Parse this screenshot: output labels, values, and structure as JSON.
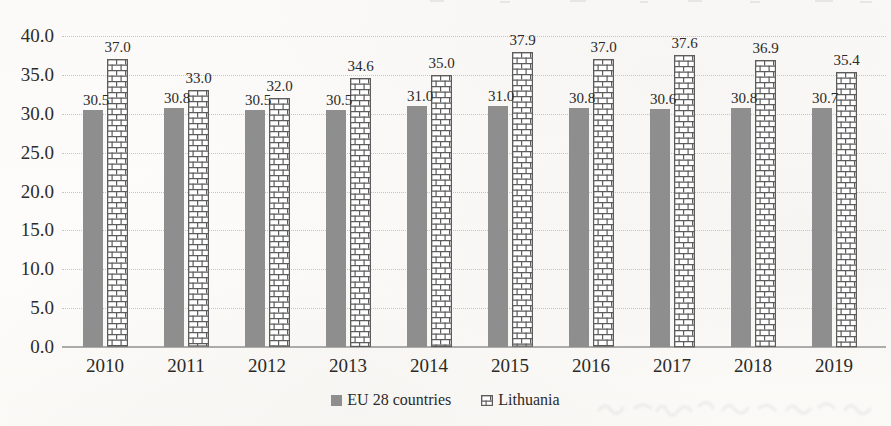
{
  "chart_data": {
    "type": "bar",
    "title": "",
    "xlabel": "",
    "ylabel": "",
    "categories": [
      "2010",
      "2011",
      "2012",
      "2013",
      "2014",
      "2015",
      "2016",
      "2017",
      "2018",
      "2019"
    ],
    "series": [
      {
        "name": "EU 28 countries",
        "pattern": "solid",
        "color": "#8e8e8e",
        "values": [
          30.5,
          30.8,
          30.5,
          30.5,
          31.0,
          31.0,
          30.8,
          30.6,
          30.8,
          30.7
        ],
        "labels": [
          "30.5",
          "30.8",
          "30.5",
          "30.5",
          "31.0",
          "31.0",
          "30.8",
          "30.6",
          "30.8",
          "30.7"
        ]
      },
      {
        "name": "Lithuania",
        "pattern": "brick",
        "color": "#ffffff",
        "outline": "#5c5c5c",
        "values": [
          37.0,
          33.0,
          32.0,
          34.6,
          35.0,
          37.9,
          37.0,
          37.6,
          36.9,
          35.4
        ],
        "labels": [
          "37.0",
          "33.0",
          "32.0",
          "34.6",
          "35.0",
          "37.9",
          "37.0",
          "37.6",
          "36.9",
          "35.4"
        ]
      }
    ],
    "ylim": [
      0,
      40
    ],
    "ytick_step": 5,
    "ytick_labels": [
      "0.0",
      "5.0",
      "10.0",
      "15.0",
      "20.0",
      "25.0",
      "30.0",
      "35.0",
      "40.0"
    ],
    "grid": "horizontal-dotted",
    "data_labels": true,
    "legend_position": "bottom-center"
  },
  "colors": {
    "paper": "#fbfaf8",
    "grid": "#c6c5c2",
    "axis": "#ababa8",
    "bar_gray": "#8e8e8e",
    "brick_outline": "#5c5c5c",
    "text": "#2b2a28"
  }
}
